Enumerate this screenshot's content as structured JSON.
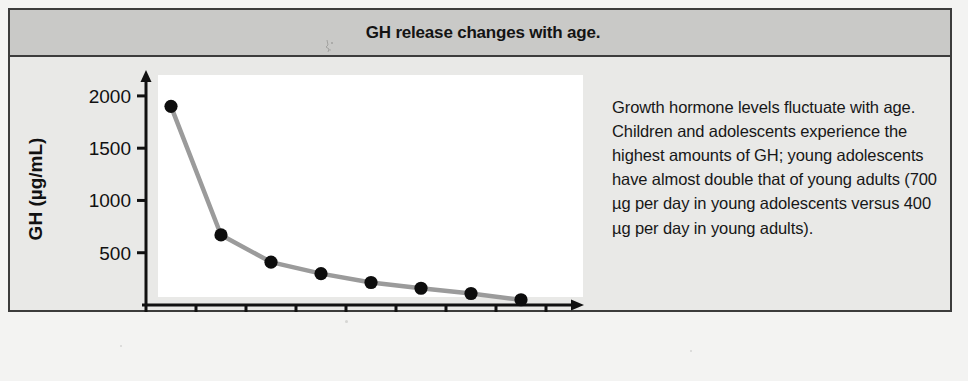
{
  "figure": {
    "title": "GH release changes with age.",
    "caption": "Growth hormone levels fluctuate with age. Children and adolescents experience the highest amounts of GH; young adolescents have almost double that of young adults (700 µg per day in young adolescents versus 400 µg per day in young adults).",
    "colors": {
      "banner_background": "#c9c9c7",
      "body_background": "#e9e9e7",
      "plot_background": "#ffffff",
      "frame_border": "#3c3c3c",
      "line": "#9b9b9b",
      "marker": "#0d0d0d",
      "axis": "#111111",
      "text": "#141414"
    }
  },
  "chart_data": {
    "type": "line",
    "title": "GH release changes with age.",
    "xlabel": "Age in years",
    "ylabel": "GH (µg/mL)",
    "x": [
      5,
      15,
      25,
      35,
      45,
      55,
      65,
      75
    ],
    "values": [
      1900,
      670,
      410,
      300,
      215,
      160,
      110,
      50
    ],
    "series": [
      {
        "name": "GH release",
        "x": [
          5,
          15,
          25,
          35,
          45,
          55,
          65,
          75
        ],
        "values": [
          1900,
          670,
          410,
          300,
          215,
          160,
          110,
          50
        ]
      }
    ],
    "xlim": [
      0,
      80
    ],
    "ylim": [
      0,
      2200
    ],
    "xticks": [
      0,
      10,
      20,
      30,
      40,
      50,
      60,
      70,
      80
    ],
    "xtick_labels": [
      "0",
      "10",
      "20",
      "30",
      "40",
      "50",
      "60",
      "70",
      "80"
    ],
    "yticks": [
      500,
      1000,
      1500,
      2000
    ],
    "ytick_labels": [
      "500",
      "1000",
      "1500",
      "2000"
    ],
    "grid": false,
    "legend": "none",
    "markers": "filled-circle",
    "axis_arrows": true
  }
}
